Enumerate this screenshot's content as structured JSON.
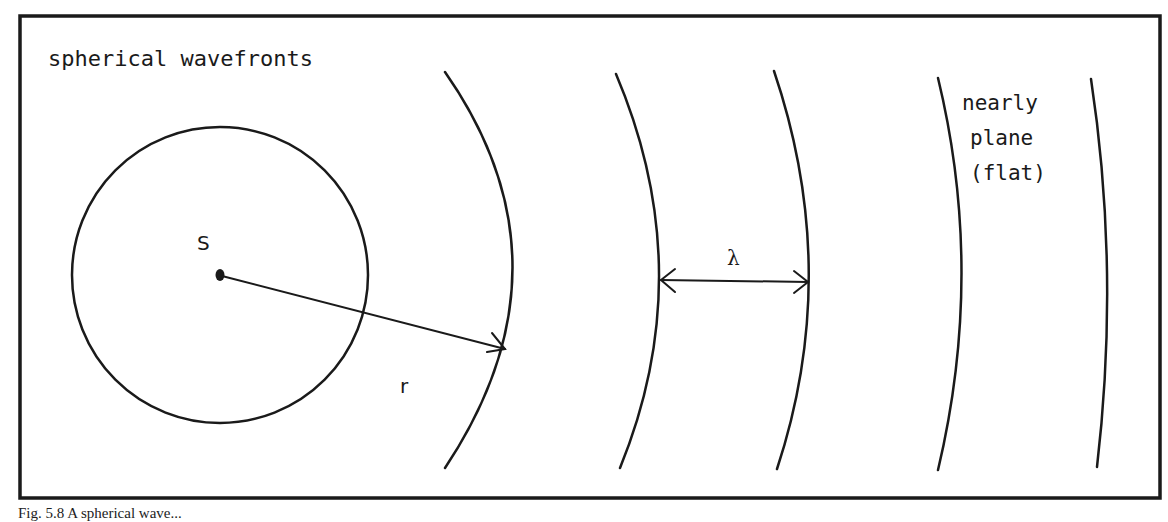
{
  "diagram": {
    "title_label": "spherical wavefronts",
    "source_label": "S",
    "radius_label": "r",
    "wavelength_label": "λ",
    "plane_label_lines": [
      "nearly",
      "plane",
      "(flat)"
    ],
    "caption_fragment": "Fig. 5.8  A spherical wave..."
  },
  "colors": {
    "ink": "#1a1a1a",
    "background": "#ffffff"
  }
}
